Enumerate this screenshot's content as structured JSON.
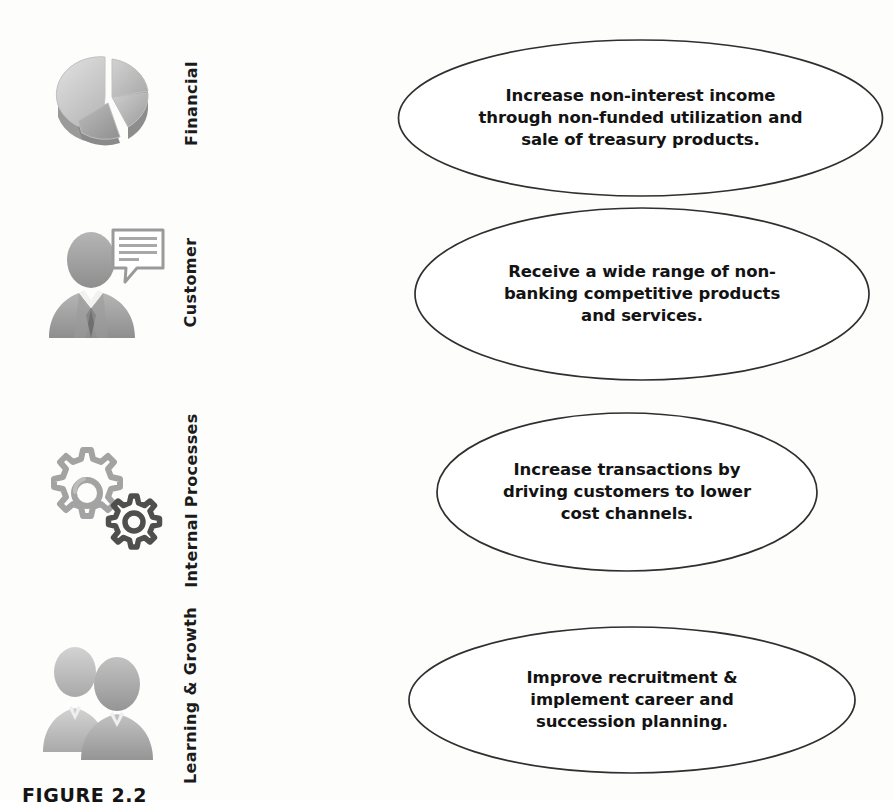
{
  "figure": {
    "caption": "FIGURE 2.2",
    "background_color": "#fdfdfc",
    "ellipse_stroke_color": "#2b2b2b",
    "text_color": "#131313",
    "icon_color": "#9d9d9d"
  },
  "perspectives": [
    {
      "label": "Financial",
      "icon": "pie-chart-icon",
      "objective": "Increase non-interest income\nthrough non-funded utilization and\nsale of treasury products."
    },
    {
      "label": "Customer",
      "icon": "customer-speech-bubble-icon",
      "objective": "Receive a wide range of non-\nbanking competitive products\nand services."
    },
    {
      "label": "Internal Processes",
      "icon": "gears-icon",
      "objective": "Increase transactions by\ndriving customers to lower\ncost channels."
    },
    {
      "label": "Learning & Growth",
      "icon": "people-group-icon",
      "objective": "Improve recruitment &\nimplement career and\nsuccession planning."
    }
  ]
}
